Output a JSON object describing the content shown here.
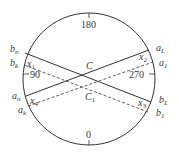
{
  "diagram": {
    "type": "circle-cross-section",
    "angle_labels": {
      "top": "180",
      "bottom": "0",
      "left": "90",
      "right": "270"
    },
    "center_labels": {
      "C": "C",
      "C1_base": "C",
      "C1_sub": "1"
    },
    "endpoints": {
      "b_n": {
        "base": "b",
        "sub": "n"
      },
      "b_k": {
        "base": "b",
        "sub": "k"
      },
      "a_n": {
        "base": "a",
        "sub": "n"
      },
      "a_k": {
        "base": "a",
        "sub": "k"
      },
      "a_L": {
        "base": "a",
        "sub": "L"
      },
      "a_1": {
        "base": "a",
        "sub": "1"
      },
      "b_L": {
        "base": "b",
        "sub": "L"
      },
      "b_1": {
        "base": "b",
        "sub": "1"
      }
    },
    "x_labels": {
      "x1": {
        "base": "x",
        "sub": "1"
      },
      "x2": {
        "base": "x",
        "sub": "2"
      },
      "x3": {
        "base": "x",
        "sub": "3"
      },
      "x4": {
        "base": "x",
        "sub": "4"
      }
    },
    "lines": [
      {
        "name": "chord-bn-bL",
        "style": "solid"
      },
      {
        "name": "chord-an-aL",
        "style": "solid"
      },
      {
        "name": "chord-bk-b1",
        "style": "dashed"
      },
      {
        "name": "chord-ak-a1",
        "style": "dashed"
      }
    ],
    "colors": {
      "stroke": "#333333",
      "text": "#3a3a3a"
    }
  }
}
